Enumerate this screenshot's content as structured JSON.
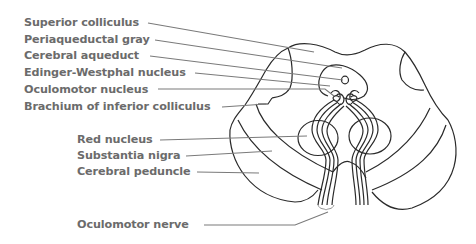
{
  "diagram": {
    "labels": [
      {
        "id": "superior-colliculus",
        "text": "Superior colliculus",
        "x": 24,
        "y": 17
      },
      {
        "id": "periaqueductal-gray",
        "text": "Periaqueductal gray",
        "x": 24,
        "y": 34
      },
      {
        "id": "cerebral-aqueduct",
        "text": "Cerebral aqueduct",
        "x": 24,
        "y": 51
      },
      {
        "id": "edinger-westphal-nucleus",
        "text": "Edinger-Westphal nucleus",
        "x": 24,
        "y": 67
      },
      {
        "id": "oculomotor-nucleus",
        "text": "Oculomotor nucleus",
        "x": 24,
        "y": 84
      },
      {
        "id": "brachium-of-inferior-colliculus",
        "text": "Brachium of inferior colliculus",
        "x": 24,
        "y": 100
      },
      {
        "id": "red-nucleus",
        "text": "Red nucleus",
        "x": 77,
        "y": 134
      },
      {
        "id": "substantia-nigra",
        "text": "Substantia nigra",
        "x": 77,
        "y": 150
      },
      {
        "id": "cerebral-peduncle",
        "text": "Cerebral peduncle",
        "x": 77,
        "y": 166
      },
      {
        "id": "oculomotor-nerve",
        "text": "Oculomotor nerve",
        "x": 77,
        "y": 218
      }
    ],
    "colors": {
      "label_text": "#6b6b6b",
      "leader_line": "#7a7a7a",
      "outline": "#2a2a2a",
      "background": "#ffffff"
    }
  }
}
